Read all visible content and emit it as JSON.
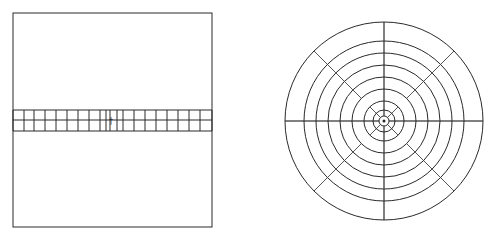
{
  "figure": {
    "caption_fragment": "",
    "stroke_color": "#2a2a2a",
    "background": "#ffffff"
  },
  "left_panel": {
    "type": "square-domain-with-strip-grid",
    "frame": {
      "x": 13,
      "y": 13,
      "width": 199,
      "height": 214
    },
    "strip": {
      "y_top": 110,
      "y_mid": 120,
      "y_bottom": 131,
      "rows": 2
    },
    "column_x": [
      13,
      24,
      34,
      45,
      56,
      67,
      78,
      89,
      100,
      106,
      110,
      117,
      123,
      134,
      145,
      156,
      167,
      178,
      189,
      200,
      212
    ],
    "marker": {
      "label": "†",
      "x": 111,
      "y": 121
    }
  },
  "right_panel": {
    "type": "concentric-ring-grid",
    "center": {
      "x": 384,
      "y": 121
    },
    "ring_radii": [
      5,
      11,
      20,
      32,
      44,
      56,
      68,
      80,
      99
    ],
    "spokes_per_ring": [
      8,
      8,
      4,
      8,
      8,
      8,
      8,
      8
    ],
    "inner_hub": {
      "radius": 11,
      "spokes": 8
    }
  }
}
